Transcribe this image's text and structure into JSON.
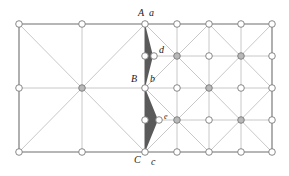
{
  "diagram": {
    "type": "mesh-refinement-diagram",
    "colors": {
      "border_line": "#6e6e6e",
      "inner_line": "#c2c2c2",
      "node_stroke": "#7a7a7a",
      "node_fill": "#ffffff",
      "node_fill_crossing": "#b8b8b8",
      "shaded_region": "#5a5a5a"
    },
    "left_square": {
      "x0": 19,
      "y0": 24,
      "x1": 145,
      "y1": 152,
      "nodes": [
        {
          "x": 19,
          "y": 24,
          "crossing": false
        },
        {
          "x": 82,
          "y": 24,
          "crossing": false
        },
        {
          "x": 19,
          "y": 88,
          "crossing": false
        },
        {
          "x": 82,
          "y": 88,
          "crossing": true
        },
        {
          "x": 19,
          "y": 152,
          "crossing": false
        },
        {
          "x": 82,
          "y": 152,
          "crossing": false
        }
      ]
    },
    "right_grid": {
      "columns": [
        145,
        177,
        209,
        241,
        272
      ],
      "rows": [
        24,
        56,
        88,
        120,
        152
      ],
      "crossing_nodes": [
        [
          177,
          56
        ],
        [
          241,
          56
        ],
        [
          209,
          88
        ],
        [
          177,
          120
        ],
        [
          241,
          120
        ]
      ]
    },
    "shaded_triangles": [
      {
        "points": [
          [
            145,
            24
          ],
          [
            153,
            56
          ],
          [
            145,
            88
          ]
        ]
      },
      {
        "points": [
          [
            145,
            88
          ],
          [
            158,
            120
          ],
          [
            145,
            152
          ]
        ]
      }
    ],
    "extra_nodes": [
      {
        "name": "d",
        "x": 154,
        "y": 56
      },
      {
        "name": "e",
        "x": 159,
        "y": 120
      }
    ],
    "labels": {
      "A": "A",
      "a": "a",
      "B": "B",
      "b": "b",
      "C": "C",
      "c": "c",
      "d": "d",
      "e": "e"
    }
  }
}
